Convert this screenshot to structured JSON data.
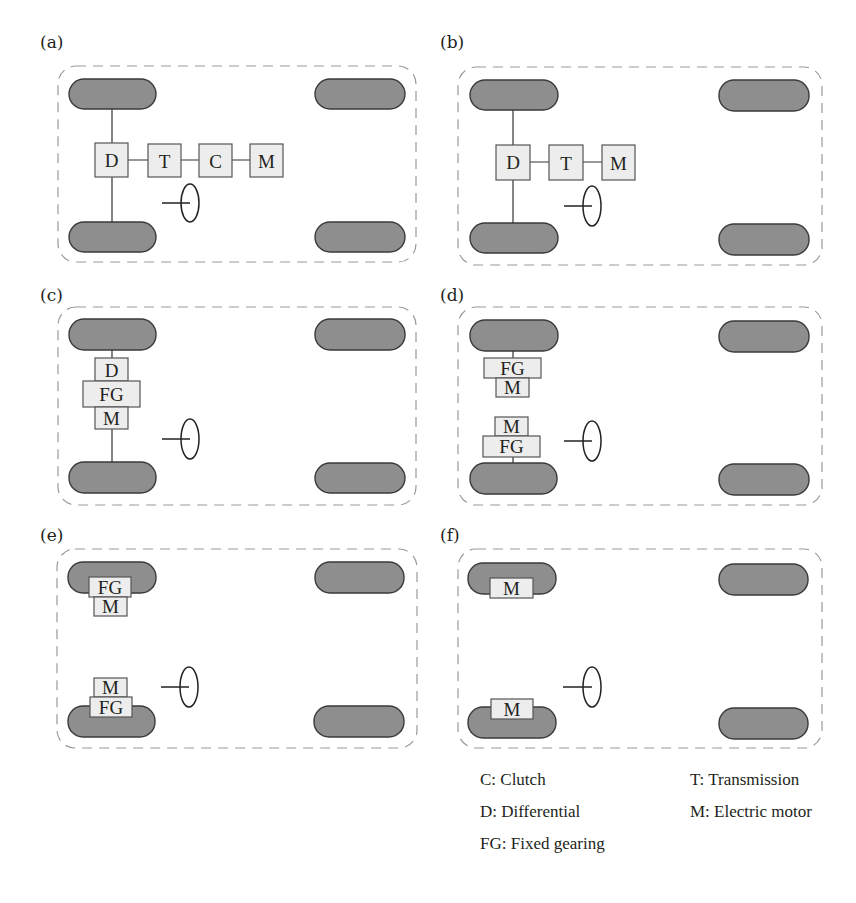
{
  "figure": {
    "panels": [
      {
        "id": "a",
        "label": "(a)",
        "components": [
          "D",
          "T",
          "C",
          "M"
        ],
        "layout": "central-axial"
      },
      {
        "id": "b",
        "label": "(b)",
        "components": [
          "D",
          "T",
          "M"
        ],
        "layout": "central-axial"
      },
      {
        "id": "c",
        "label": "(c)",
        "components": [
          "D",
          "FG",
          "M"
        ],
        "layout": "central-stacked"
      },
      {
        "id": "d",
        "label": "(d)",
        "components": [
          "FG",
          "M",
          "M",
          "FG"
        ],
        "layout": "dual-motor-inboard"
      },
      {
        "id": "e",
        "label": "(e)",
        "components": [
          "FG",
          "M",
          "M",
          "FG"
        ],
        "layout": "dual-motor-wheel-mounted"
      },
      {
        "id": "f",
        "label": "(f)",
        "components": [
          "M",
          "M"
        ],
        "layout": "in-wheel-motor"
      }
    ],
    "legend": [
      {
        "abbr": "C",
        "text": "C: Clutch"
      },
      {
        "abbr": "T",
        "text": "T: Transmission"
      },
      {
        "abbr": "D",
        "text": "D: Differential"
      },
      {
        "abbr": "M",
        "text": "M: Electric motor"
      },
      {
        "abbr": "FG",
        "text": "FG: Fixed gearing"
      }
    ],
    "colors": {
      "wheel_fill": "#8e8e8e",
      "component_fill": "#ededed",
      "chassis_outline": "#9a9a9a"
    }
  }
}
